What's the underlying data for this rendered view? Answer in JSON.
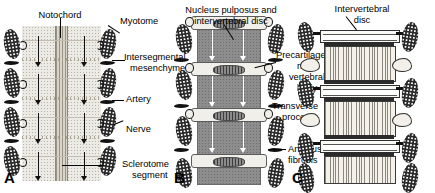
{
  "figure": {
    "panels": [
      {
        "letter": "A",
        "name": "sclerotome-resegmentation",
        "labels": [
          {
            "key": "notochord",
            "text": "Notochord"
          },
          {
            "key": "myotome",
            "text": "Myotome"
          },
          {
            "key": "intersegmental_mesenchyme",
            "text": "Intersegmental\nmesenchyme"
          },
          {
            "key": "artery",
            "text": "Artery"
          },
          {
            "key": "nerve",
            "text": "Nerve"
          },
          {
            "key": "sclerotome_segment",
            "text": "Sclerotome\nsegment"
          }
        ]
      },
      {
        "letter": "B",
        "name": "precartilaginous-vertebrae",
        "labels": [
          {
            "key": "nucleus_pulposus",
            "text": "Nucleus pulposus and\nintervertebral disc"
          },
          {
            "key": "precartilaginous_body",
            "text": "Precartilage-\nnous\nvertebral\nbody"
          },
          {
            "key": "transverse_process",
            "text": "Transverse\nprocess"
          },
          {
            "key": "annulus_fibrosis",
            "text": "Annulus\nfibrosis"
          }
        ]
      },
      {
        "letter": "C",
        "name": "cartilaginous-vertebrae",
        "labels": [
          {
            "key": "intervertebral_disc",
            "text": "Intervertebral\ndisc"
          }
        ]
      }
    ]
  },
  "panelA": {
    "label_notochord": "Notochord",
    "label_myotome": "Myotome",
    "label_intersegmental_1": "Intersegmental",
    "label_intersegmental_2": "mesenchyme",
    "label_artery": "Artery",
    "label_nerve": "Nerve",
    "label_sclerotome_1": "Sclerotome",
    "label_sclerotome_2": "segment",
    "letter": "A"
  },
  "panelB": {
    "label_nucleus_1": "Nucleus pulposus and",
    "label_nucleus_2": "intervertebral disc",
    "label_precart_1": "Precartilage-",
    "label_precart_2": "nous",
    "label_precart_3": "vertebral",
    "label_precart_4": "body",
    "label_transverse_1": "Transverse",
    "label_transverse_2": "process",
    "label_annulus_1": "Annulus",
    "label_annulus_2": "fibrosis",
    "letter": "B"
  },
  "panelC": {
    "label_disc_1": "Intervertebral",
    "label_disc_2": "disc",
    "letter": "C"
  },
  "colors": {
    "somite": "#2a2a2a",
    "notochord": "#d8d4c8",
    "panelA_body": "#eceae4",
    "vertebral_body_B": "#8d8d8d",
    "disc_light": "#f0efe9",
    "ink": "#000000"
  }
}
